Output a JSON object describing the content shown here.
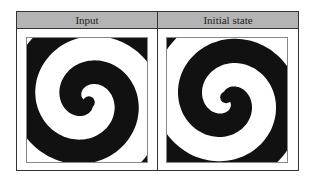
{
  "table": {
    "columns": [
      {
        "label": "Input"
      },
      {
        "label": "Initial state"
      }
    ]
  },
  "panels": [
    {
      "name": "input",
      "rotation_deg": 0,
      "turns": 3.2,
      "color_dark": "#111111",
      "color_light": "#ffffff"
    },
    {
      "name": "initial-state",
      "rotation_deg": 200,
      "turns": 3.2,
      "color_dark": "#111111",
      "color_light": "#ffffff"
    }
  ],
  "colors": {
    "header_bg": "#b4b4b4",
    "border": "#333333"
  }
}
